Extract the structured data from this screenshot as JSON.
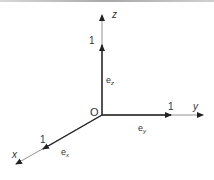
{
  "diagram": {
    "title": "",
    "origin_label": "O",
    "axes": [
      {
        "name": "x",
        "label": "x",
        "unit_label": "1",
        "vector_label": "e",
        "vector_subscript": "x"
      },
      {
        "name": "y",
        "label": "y",
        "unit_label": "1",
        "vector_label": "e",
        "vector_subscript": "y"
      },
      {
        "name": "z",
        "label": "z",
        "unit_label": "1",
        "vector_label": "e",
        "vector_subscript": "z"
      }
    ],
    "colors": {
      "axis": "#555555",
      "unit_vector": "#222222",
      "text": "#333333"
    }
  }
}
